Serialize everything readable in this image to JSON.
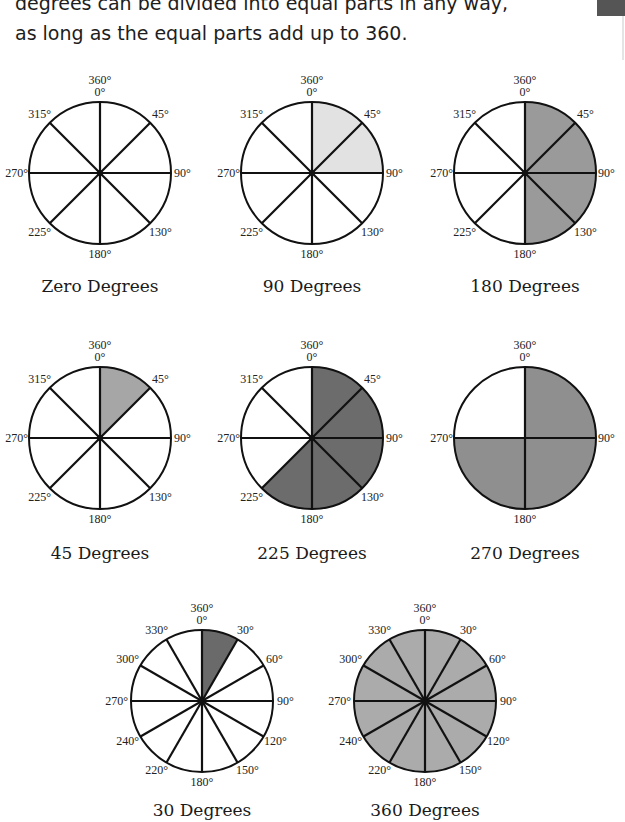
{
  "intro": {
    "line1": "degrees can be divided into equal parts in any way,",
    "line2": "as long as the equal parts add up to 360."
  },
  "colors": {
    "stroke": "#111111",
    "unshaded": "#ffffff",
    "light_gray": "#e2e2e2",
    "mid_gray": "#9f9f9f",
    "dark_gray": "#6e6e6e",
    "gray_fill": "#8c8c8c",
    "full_fill": "#a9a9a9"
  },
  "diagrams": [
    {
      "caption": "Zero Degrees",
      "divisions": 8,
      "shaded_sectors": 0,
      "fill": "#ffffff",
      "labels": {
        "top": "360°",
        "zero": "0°",
        "l45": "45°",
        "l90": "90°",
        "l135": "130°",
        "l180": "180°",
        "l225": "225°",
        "l270": "270°",
        "l315": "315°"
      }
    },
    {
      "caption": "90 Degrees",
      "divisions": 8,
      "shaded_sectors": 2,
      "fill": "#e2e2e2",
      "labels": {
        "top": "360°",
        "zero": "0°",
        "l45": "45°",
        "l90": "90°",
        "l135": "130°",
        "l180": "180°",
        "l225": "225°",
        "l270": "270°",
        "l315": "315°"
      }
    },
    {
      "caption": "180 Degrees",
      "divisions": 8,
      "shaded_sectors": 4,
      "fill": "#9a9a9a",
      "labels": {
        "top": "360°",
        "zero": "0°",
        "l45": "45°",
        "l90": "90°",
        "l135": "130°",
        "l180": "180°",
        "l225": "225°",
        "l270": "270°",
        "l315": "315°"
      }
    },
    {
      "caption": "45 Degrees",
      "divisions": 8,
      "shaded_sectors": 1,
      "fill": "#a6a6a6",
      "labels": {
        "top": "360°",
        "zero": "0°",
        "l45": "45°",
        "l90": "90°",
        "l135": "130°",
        "l180": "180°",
        "l225": "225°",
        "l270": "270°",
        "l315": "315°"
      }
    },
    {
      "caption": "225 Degrees",
      "divisions": 8,
      "shaded_sectors": 5,
      "fill": "#6c6c6c",
      "labels": {
        "top": "360°",
        "zero": "0°",
        "l45": "45°",
        "l90": "90°",
        "l135": "130°",
        "l180": "180°",
        "l225": "225°",
        "l270": "270°",
        "l315": "315°"
      }
    },
    {
      "caption": "270 Degrees",
      "divisions": 4,
      "shaded_sectors": 3,
      "fill": "#8f8f8f",
      "labels": {
        "top": "360°",
        "zero": "0°",
        "l90": "90°",
        "l180": "180°",
        "l270": "270°"
      }
    },
    {
      "caption": "30 Degrees",
      "divisions": 12,
      "shaded_sectors": 1,
      "fill": "#6a6a6a",
      "labels": {
        "top": "360°",
        "zero": "0°",
        "l30": "30°",
        "l60": "60°",
        "l90": "90°",
        "l120": "120°",
        "l150": "150°",
        "l180": "180°",
        "l210": "220°",
        "l240": "240°",
        "l270": "270°",
        "l300": "300°",
        "l330": "330°"
      }
    },
    {
      "caption": "360 Degrees",
      "divisions": 12,
      "shaded_sectors": 12,
      "fill": "#ababab",
      "labels": {
        "top": "360°",
        "zero": "0°",
        "l30": "30°",
        "l60": "60°",
        "l90": "90°",
        "l120": "120°",
        "l150": "150°",
        "l180": "180°",
        "l210": "220°",
        "l240": "240°",
        "l270": "270°",
        "l300": "300°",
        "l330": "330°"
      }
    }
  ]
}
